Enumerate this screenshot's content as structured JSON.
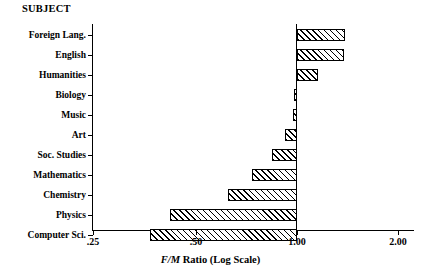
{
  "heading": "SUBJECT",
  "axis": {
    "title_italic": "F/M",
    "title_rest": " Ratio (Log Scale)",
    "title_full": "F/M Ratio (Log Scale)",
    "ticks": [
      {
        "label": ".25",
        "value": 0.25,
        "x": 93
      },
      {
        "label": ".50",
        "value": 0.5,
        "x": 196
      },
      {
        "label": "1.00",
        "value": 1.0,
        "x": 297
      },
      {
        "label": "2.00",
        "value": 2.0,
        "x": 398
      }
    ]
  },
  "rows": [
    {
      "label": "Foreign Lang.",
      "value": 1.38,
      "x1": 297,
      "x2": 345,
      "top": 26
    },
    {
      "label": "English",
      "value": 1.37,
      "x1": 297,
      "x2": 344,
      "top": 46
    },
    {
      "label": "Humanities",
      "value": 1.16,
      "x1": 297,
      "x2": 318,
      "top": 66
    },
    {
      "label": "Biology",
      "value": 0.99,
      "x1": 294,
      "x2": 297,
      "top": 86
    },
    {
      "label": "Music",
      "value": 0.98,
      "x1": 293,
      "x2": 297,
      "top": 106
    },
    {
      "label": "Art",
      "value": 0.92,
      "x1": 285,
      "x2": 297,
      "top": 126
    },
    {
      "label": "Soc. Studies",
      "value": 0.85,
      "x1": 272,
      "x2": 297,
      "top": 146
    },
    {
      "label": "Mathematics",
      "value": 0.74,
      "x1": 252,
      "x2": 297,
      "top": 166
    },
    {
      "label": "Chemistry",
      "value": 0.63,
      "x1": 228,
      "x2": 297,
      "top": 186
    },
    {
      "label": "Physics",
      "value": 0.42,
      "x1": 170,
      "x2": 297,
      "top": 206
    },
    {
      "label": "Computer Sci.",
      "value": 0.37,
      "x1": 150,
      "x2": 297,
      "top": 226
    }
  ],
  "chart_data": {
    "type": "bar",
    "orientation": "horizontal",
    "title": "SUBJECT",
    "xlabel": "F/M Ratio (Log Scale)",
    "ylabel": "SUBJECT",
    "xscale": "log",
    "xlim": [
      0.25,
      2.0
    ],
    "xticks": [
      0.25,
      0.5,
      1.0,
      2.0
    ],
    "xticklabels": [
      ".25",
      ".50",
      "1.00",
      "2.00"
    ],
    "baseline": 1.0,
    "grid": false,
    "legend": false,
    "bar_fill": "diagonal-hatch",
    "categories": [
      "Foreign Lang.",
      "English",
      "Humanities",
      "Biology",
      "Music",
      "Art",
      "Soc. Studies",
      "Mathematics",
      "Chemistry",
      "Physics",
      "Computer Sci."
    ],
    "values": [
      1.38,
      1.37,
      1.16,
      0.99,
      0.98,
      0.92,
      0.85,
      0.74,
      0.63,
      0.42,
      0.37
    ]
  }
}
